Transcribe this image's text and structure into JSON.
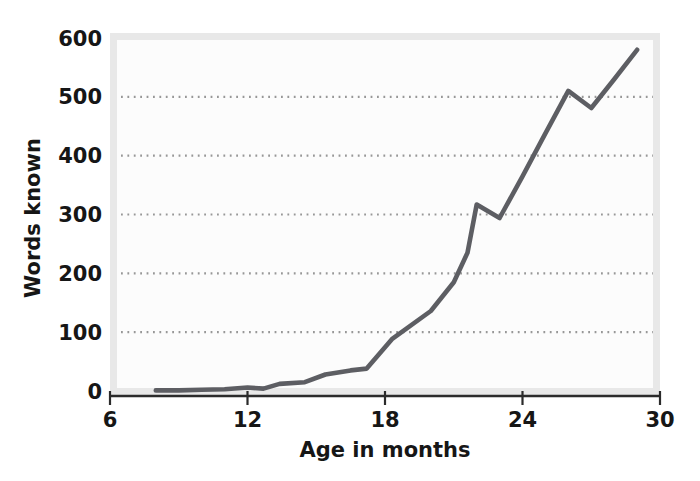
{
  "chart_data": {
    "type": "line",
    "title": "",
    "xlabel": "Age in months",
    "ylabel": "Words known",
    "xlim": [
      6,
      30
    ],
    "ylim": [
      0,
      600
    ],
    "x_ticks": [
      6,
      12,
      18,
      24,
      30
    ],
    "y_ticks": [
      0,
      100,
      200,
      300,
      400,
      500,
      600
    ],
    "grid": "dotted horizontal gridlines at 100, 200, 300, 400, 500",
    "legend": "none",
    "series": [
      {
        "name": "Words known",
        "x": [
          8,
          9,
          10,
          11,
          12,
          12.7,
          13.4,
          14.5,
          15.4,
          16.5,
          17.2,
          18.3,
          20,
          21,
          21.6,
          22,
          23,
          24,
          25,
          26,
          27,
          28,
          29
        ],
        "y": [
          1,
          1,
          2,
          3,
          6,
          4,
          12,
          15,
          28,
          35,
          38,
          88,
          136,
          185,
          235,
          317,
          294,
          365,
          438,
          510,
          481,
          530,
          580
        ]
      }
    ]
  },
  "style": {
    "line_color": "#5d5e63",
    "grid_dot_color": "#979797",
    "axis_color": "#2b2b2b",
    "frame_band_color": "#e8e8e8",
    "plot_bg": "#fcfcfc",
    "page_bg": "#ffffff",
    "text_color": "#161616"
  }
}
